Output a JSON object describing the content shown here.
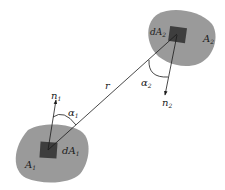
{
  "diagram": {
    "type": "radiation-view-factor",
    "colors": {
      "surface_fill": "#9a9a9a",
      "element_fill": "#3e3e3e",
      "line": "#1a1a1a",
      "background": "#ffffff"
    },
    "surfaces": [
      {
        "id": "A1",
        "label": "A",
        "subscript": "1",
        "element_label": "dA",
        "element_subscript": "1"
      },
      {
        "id": "A2",
        "label": "A",
        "subscript": "2",
        "element_label": "dA",
        "element_subscript": "2"
      }
    ],
    "normals": [
      {
        "id": "n1",
        "label": "n",
        "subscript": "1"
      },
      {
        "id": "n2",
        "label": "n",
        "subscript": "2"
      }
    ],
    "angles": [
      {
        "id": "alpha1",
        "label": "α",
        "subscript": "1"
      },
      {
        "id": "alpha2",
        "label": "α",
        "subscript": "2"
      }
    ],
    "distance": {
      "label": "r"
    }
  }
}
